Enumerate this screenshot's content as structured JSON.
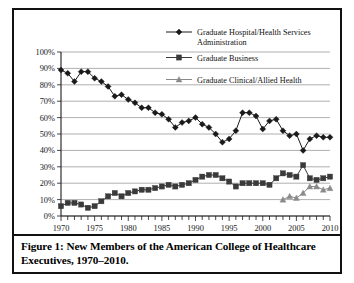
{
  "figure": {
    "caption": "Figure 1: New Members of the American College of Healthcare Executives, 1970–2010."
  },
  "chart_data": {
    "type": "line",
    "title": "",
    "xlabel": "",
    "ylabel": "",
    "xlim": [
      1970,
      2010
    ],
    "ylim": [
      0,
      100
    ],
    "ytick_labels": [
      "0%",
      "10%",
      "20%",
      "30%",
      "40%",
      "50%",
      "60%",
      "70%",
      "80%",
      "90%",
      "100%"
    ],
    "ytick_values": [
      0,
      10,
      20,
      30,
      40,
      50,
      60,
      70,
      80,
      90,
      100
    ],
    "xtick_labels": [
      "1970",
      "1975",
      "1980",
      "1985",
      "1990",
      "1995",
      "2000",
      "2005",
      "2010"
    ],
    "xtick_values": [
      1970,
      1975,
      1980,
      1985,
      1990,
      1995,
      2000,
      2005,
      2010
    ],
    "x_minor_tick_interval": 1,
    "grid": "horizontal",
    "legend_position": "top-right",
    "x": [
      1970,
      1971,
      1972,
      1973,
      1974,
      1975,
      1976,
      1977,
      1978,
      1979,
      1980,
      1981,
      1982,
      1983,
      1984,
      1985,
      1986,
      1987,
      1988,
      1989,
      1990,
      1991,
      1992,
      1993,
      1994,
      1995,
      1996,
      1997,
      1998,
      1999,
      2000,
      2001,
      2002,
      2003,
      2004,
      2005,
      2006,
      2007,
      2008,
      2009,
      2010
    ],
    "series": [
      {
        "name": "Graduate Hospital/Health Services Administration",
        "marker": "diamond",
        "color": "#1a1a1a",
        "values": [
          89,
          87,
          82,
          88,
          88,
          84,
          82,
          79,
          73,
          74,
          71,
          69,
          66,
          66,
          63,
          62,
          59,
          54,
          57,
          58,
          60,
          56,
          54,
          50,
          45,
          47,
          52,
          63,
          63,
          61,
          53,
          58,
          59,
          52,
          49,
          50,
          40,
          47,
          49,
          48,
          48
        ]
      },
      {
        "name": "Graduate Business",
        "marker": "square",
        "color": "#3a3a3a",
        "values": [
          6,
          8,
          8,
          7,
          5,
          6,
          9,
          12,
          14,
          12,
          14,
          15,
          16,
          16,
          17,
          18,
          19,
          18,
          19,
          20,
          22,
          24,
          25,
          25,
          23,
          21,
          18,
          20,
          20,
          20,
          20,
          19,
          23,
          26,
          25,
          24,
          31,
          23,
          22,
          23,
          24
        ]
      },
      {
        "name": "Graduate Clinical/Allied Health",
        "marker": "triangle",
        "color": "#8a8a8a",
        "values": [
          null,
          null,
          null,
          null,
          null,
          null,
          null,
          null,
          null,
          null,
          null,
          null,
          null,
          null,
          null,
          null,
          null,
          null,
          null,
          null,
          null,
          null,
          null,
          null,
          null,
          null,
          null,
          null,
          null,
          null,
          null,
          null,
          null,
          10,
          12,
          11,
          14,
          18,
          18,
          16,
          17
        ]
      }
    ]
  },
  "legend": {
    "items": [
      {
        "label_line1": "Graduate Hospital/Health Services",
        "label_line2": "Administration"
      },
      {
        "label_line1": "Graduate Business",
        "label_line2": ""
      },
      {
        "label_line1": "Graduate Clinical/Allied Health",
        "label_line2": ""
      }
    ]
  }
}
